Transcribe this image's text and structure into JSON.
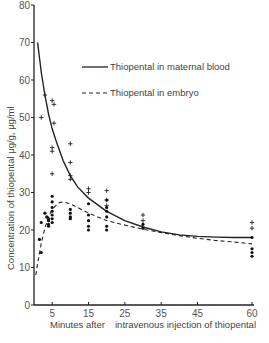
{
  "chart_data": {
    "type": "line",
    "title": "",
    "xlabel_left": "Minutes after",
    "xlabel_right": "intravenous injection of thiopental",
    "xlabel": "Minutes after intravenous injection of thiopental",
    "ylabel": "Concentration of thiopental μg/g, μg/ml",
    "xlim": [
      0,
      60
    ],
    "ylim": [
      0,
      80
    ],
    "xticks": [
      5,
      15,
      25,
      35,
      45,
      60
    ],
    "yticks": [
      0,
      10,
      20,
      30,
      40,
      50,
      60,
      70,
      80
    ],
    "grid": false,
    "legend_position": "upper right",
    "legend": [
      {
        "label": "Thiopental in maternal blood",
        "style": "solid"
      },
      {
        "label": "Thiopental in embryo",
        "style": "dashed"
      }
    ],
    "series": [
      {
        "name": "Thiopental in maternal blood",
        "style": "solid",
        "curve": {
          "x": [
            1,
            2,
            3,
            4,
            5,
            6,
            8,
            10,
            12,
            15,
            20,
            25,
            30,
            35,
            40,
            45,
            50,
            55,
            60
          ],
          "y": [
            70,
            62,
            56,
            51,
            47,
            44,
            38.5,
            34.5,
            31.5,
            28.5,
            25,
            22.5,
            20.8,
            19.5,
            18.7,
            18.3,
            18.1,
            18,
            18
          ]
        },
        "points": {
          "marker": "+",
          "x": [
            3,
            2,
            5,
            5.5,
            5.5,
            5,
            5,
            5,
            10,
            10,
            10,
            10,
            15,
            15,
            20,
            20,
            20,
            30,
            30,
            60,
            60
          ],
          "y": [
            56,
            50,
            54.5,
            53.5,
            48.5,
            42,
            41,
            35,
            43,
            38,
            34.5,
            33.5,
            31,
            30,
            30.5,
            28,
            26.5,
            24,
            22.5,
            22,
            20.5
          ]
        }
      },
      {
        "name": "Thiopental in embryo",
        "style": "dashed",
        "curve": {
          "x": [
            0.5,
            1,
            2,
            3,
            4,
            5,
            6,
            7,
            8,
            10,
            12,
            15,
            20,
            25,
            30,
            35,
            40,
            45,
            50,
            55,
            60
          ],
          "y": [
            8,
            11,
            16.5,
            20.5,
            23.5,
            25.5,
            26.5,
            27.3,
            27.5,
            27,
            26,
            24.5,
            22.5,
            21.3,
            20.2,
            19.3,
            18.5,
            17.8,
            17.2,
            16.8,
            16.3
          ]
        },
        "points": {
          "marker": "•",
          "x": [
            2,
            1.5,
            2,
            3,
            3.5,
            4,
            4,
            4,
            4,
            5,
            5,
            5,
            5,
            5,
            5,
            5,
            10,
            10,
            10,
            10,
            15,
            15,
            15,
            15,
            15,
            20,
            20,
            20,
            20,
            20,
            20,
            30,
            30,
            60,
            60,
            60,
            60
          ],
          "y": [
            22,
            17.5,
            14,
            24.5,
            23.5,
            22.5,
            21.5,
            21,
            23,
            29,
            27.5,
            26,
            25,
            24,
            23,
            22,
            25.5,
            24.5,
            23.5,
            23,
            27,
            24,
            22.5,
            21,
            20,
            28,
            26,
            25,
            23.5,
            21,
            20,
            21.5,
            20.5,
            18,
            15,
            14,
            13
          ]
        }
      }
    ]
  }
}
